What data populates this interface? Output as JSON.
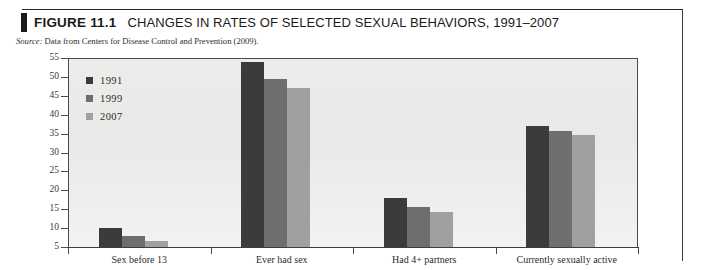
{
  "figure": {
    "label": "FIGURE 11.1",
    "title": "CHANGES IN RATES OF SELECTED SEXUAL BEHAVIORS, 1991–2007",
    "source_label": "Source:",
    "source_text": "Data from Centers for Disease Control and Prevention (2009)."
  },
  "chart_data": {
    "type": "bar",
    "title": "CHANGES IN RATES OF SELECTED SEXUAL BEHAVIORS, 1991–2007",
    "subtitle": "Source: Data from Centers for Disease Control and Prevention (2009).",
    "xlabel": "",
    "ylabel": "",
    "ylim": [
      5,
      55
    ],
    "yticks": [
      55,
      50,
      45,
      40,
      35,
      30,
      25,
      20,
      15,
      10,
      5
    ],
    "grid": false,
    "legend_position": "top-left",
    "categories": [
      "Sex before 13",
      "Ever had sex",
      "Had 4+ partners",
      "Currently sexually active"
    ],
    "series": [
      {
        "name": "1991",
        "color": "#3b3b3b",
        "values": [
          10.0,
          54.0,
          18.0,
          37.0
        ]
      },
      {
        "name": "1999",
        "color": "#6e6e6e",
        "values": [
          8.0,
          49.5,
          15.5,
          35.7
        ]
      },
      {
        "name": "2007",
        "color": "#a0a0a0",
        "values": [
          6.5,
          47.0,
          14.3,
          34.5
        ]
      }
    ]
  }
}
